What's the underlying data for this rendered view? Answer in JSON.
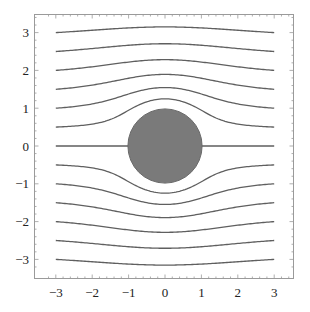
{
  "chart_data": {
    "type": "line",
    "title": "",
    "xlabel": "",
    "ylabel": "",
    "xlim": [
      -3.3,
      3.5
    ],
    "ylim": [
      -3.5,
      3.3
    ],
    "x_ticks": [
      -3,
      -2,
      -1,
      0,
      1,
      2,
      3
    ],
    "y_ticks": [
      -3,
      -2,
      -1,
      0,
      1,
      2,
      3
    ],
    "x_tick_labels": [
      "−3",
      "−2",
      "−1",
      "0",
      "1",
      "2",
      "3"
    ],
    "y_tick_labels": [
      "3",
      "2",
      "1",
      "0",
      "−1",
      "−2",
      "−3"
    ],
    "grid": false,
    "cylinder": {
      "center": [
        0,
        0
      ],
      "radius": 1,
      "fill": "#7a7a7a"
    },
    "streamline_color": "#5f5f5f",
    "streamline_x_range": [
      -3,
      3
    ],
    "series": [
      {
        "name": "y0=3",
        "start_y": 3
      },
      {
        "name": "y0=2.5",
        "start_y": 2.5
      },
      {
        "name": "y0=2",
        "start_y": 2
      },
      {
        "name": "y0=1.5",
        "start_y": 1.5
      },
      {
        "name": "y0=1",
        "start_y": 1
      },
      {
        "name": "y0=0.5",
        "start_y": 0.5
      },
      {
        "name": "y0=0",
        "start_y": 0
      },
      {
        "name": "y0=-0.5",
        "start_y": -0.5
      },
      {
        "name": "y0=-1",
        "start_y": -1
      },
      {
        "name": "y0=-1.5",
        "start_y": -1.5
      },
      {
        "name": "y0=-2",
        "start_y": -2
      },
      {
        "name": "y0=-2.5",
        "start_y": -2.5
      },
      {
        "name": "y0=-3",
        "start_y": -3
      }
    ]
  }
}
